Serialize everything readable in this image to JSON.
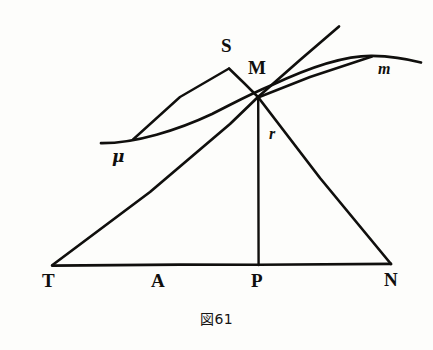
{
  "figure": {
    "caption": "図61",
    "caption_number": "61",
    "background_color": "#fdfdfb",
    "ink_color": "#100f0d",
    "width": 433,
    "height": 350
  },
  "labels": {
    "S": {
      "text": "S",
      "x": 221,
      "y": 36,
      "style": "upright"
    },
    "M": {
      "text": "M",
      "x": 248,
      "y": 58,
      "style": "upright"
    },
    "m": {
      "text": "m",
      "x": 378,
      "y": 61,
      "style": "italic"
    },
    "r": {
      "text": "r",
      "x": 269,
      "y": 126,
      "style": "italic"
    },
    "mu": {
      "text": "μ",
      "x": 112,
      "y": 148,
      "style": "greek"
    },
    "T": {
      "text": "T",
      "x": 42,
      "y": 271,
      "style": "upright"
    },
    "A": {
      "text": "A",
      "x": 151,
      "y": 271,
      "style": "upright"
    },
    "P": {
      "text": "P",
      "x": 251,
      "y": 271,
      "style": "upright"
    },
    "N": {
      "text": "N",
      "x": 384,
      "y": 270,
      "style": "upright"
    }
  },
  "geometry": {
    "points": {
      "T": {
        "x": 52,
        "y": 265
      },
      "N": {
        "x": 391,
        "y": 264
      },
      "P": {
        "x": 258,
        "y": 265
      },
      "M": {
        "x": 258,
        "y": 97
      },
      "S": {
        "x": 229,
        "y": 68
      },
      "mu_end": {
        "x": 102,
        "y": 142
      },
      "tangent_end": {
        "x": 339,
        "y": 26
      },
      "m_point": {
        "x": 372,
        "y": 57
      },
      "curve_right_end": {
        "x": 421,
        "y": 62
      },
      "curve_left_end": {
        "x": 101,
        "y": 143
      }
    },
    "segments": [
      {
        "name": "baseline-TN",
        "from": "T",
        "to": "N"
      },
      {
        "name": "tangent-through-T-M",
        "from": "T",
        "to": "tangent_end"
      },
      {
        "name": "ordinate-MP",
        "from": "M",
        "to": "P"
      },
      {
        "name": "normal-MN",
        "from": "M",
        "to": "N"
      },
      {
        "name": "subtangent-S-mu",
        "from": "S",
        "to": "mu_end"
      },
      {
        "name": "side-S-M",
        "from": "S",
        "to": "M"
      },
      {
        "name": "ray-M-m",
        "from": "M",
        "to": "m_point"
      }
    ],
    "curve": {
      "name": "curve-mu-m",
      "path": "M 101,143 C 140,142 188,124 225,107 C 248,96 262,88 286,77 C 320,62 348,55 372,56 C 392,57 408,59 421,62"
    }
  }
}
